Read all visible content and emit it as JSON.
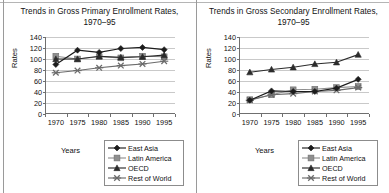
{
  "figure": {
    "panels": [
      {
        "id": "primary",
        "title_line1": "Trends in Gross Primary Enrollment Rates,",
        "title_line2": "1970–95",
        "ylabel": "Rates",
        "xlabel": "Years"
      },
      {
        "id": "secondary",
        "title_line1": "Trends in Gross Secondary Enrollment Rates,",
        "title_line2": "1970–95",
        "ylabel": "Rates",
        "xlabel": "Years"
      }
    ],
    "legend": {
      "items": [
        {
          "label": "East Asia",
          "marker": "diamond",
          "color": "#1c1c1c"
        },
        {
          "label": "Latin America",
          "marker": "square",
          "color": "#8f8f8f"
        },
        {
          "label": "OECD",
          "marker": "triangle",
          "color": "#2b2b2b"
        },
        {
          "label": "Rest of World",
          "marker": "x-cross",
          "color": "#6b6b6b"
        }
      ]
    }
  },
  "chart_data": [
    {
      "type": "line",
      "title": "Trends in Gross Primary Enrollment Rates, 1970–95",
      "xlabel": "Years",
      "ylabel": "Rates",
      "categories": [
        "1970",
        "1975",
        "1980",
        "1985",
        "1990",
        "1995"
      ],
      "x": [
        1970,
        1975,
        1980,
        1985,
        1990,
        1995
      ],
      "ylim": [
        0,
        140
      ],
      "yticks": [
        0,
        20,
        40,
        60,
        80,
        100,
        120,
        140
      ],
      "grid": true,
      "legend_position": "bottom-right",
      "series": [
        {
          "name": "East Asia",
          "marker": "diamond",
          "color": "#1c1c1c",
          "values": [
            90,
            116,
            112,
            119,
            121,
            117
          ]
        },
        {
          "name": "Latin America",
          "marker": "square",
          "color": "#8f8f8f",
          "values": [
            105,
            100,
            104,
            102,
            105,
            104
          ]
        },
        {
          "name": "OECD",
          "marker": "triangle",
          "color": "#2b2b2b",
          "values": [
            100,
            100,
            105,
            103,
            104,
            107
          ]
        },
        {
          "name": "Rest of World",
          "marker": "x-cross",
          "color": "#6b6b6b",
          "values": [
            75,
            79,
            84,
            88,
            91,
            96
          ]
        }
      ]
    },
    {
      "type": "line",
      "title": "Trends in Gross Secondary Enrollment Rates, 1970–95",
      "xlabel": "Years",
      "ylabel": "Rates",
      "categories": [
        "1970",
        "1975",
        "1980",
        "1985",
        "1990",
        "1995"
      ],
      "x": [
        1970,
        1975,
        1980,
        1985,
        1990,
        1995
      ],
      "ylim": [
        0,
        140
      ],
      "yticks": [
        0,
        20,
        40,
        60,
        80,
        100,
        120,
        140
      ],
      "grid": true,
      "legend_position": "bottom-right",
      "series": [
        {
          "name": "East Asia",
          "marker": "diamond",
          "color": "#1c1c1c",
          "values": [
            25,
            42,
            41,
            41,
            47,
            63
          ]
        },
        {
          "name": "Latin America",
          "marker": "square",
          "color": "#8f8f8f",
          "values": [
            26,
            35,
            44,
            45,
            48,
            50
          ]
        },
        {
          "name": "OECD",
          "marker": "triangle",
          "color": "#2b2b2b",
          "values": [
            76,
            81,
            85,
            91,
            94,
            108
          ]
        },
        {
          "name": "Rest of World",
          "marker": "x-cross",
          "color": "#6b6b6b",
          "values": [
            25,
            35,
            37,
            41,
            43,
            48
          ]
        }
      ]
    }
  ]
}
